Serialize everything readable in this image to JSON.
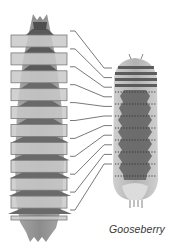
{
  "figure": {
    "caption": "Gooseberry",
    "left_body": {
      "description": "segmented larva, front view, with overlaid comparison strips",
      "strip_count": 11,
      "colors": {
        "body_light": "#bdbdbd",
        "body_mid": "#8f8f8f",
        "body_dark": "#5a5a5a",
        "strip_fill": "#c9c9c9",
        "strip_border": "#7a7a7a"
      }
    },
    "right_body": {
      "description": "gooseberry larva, dorsal view, banded head segments and dotted segment lines",
      "segment_count": 11,
      "colors": {
        "body_light": "#d6d6d6",
        "body_mid": "#9c9c9c",
        "body_dark": "#555555",
        "dot_line": "#2e2e2e"
      }
    },
    "connector_count": 11,
    "connector_color": "#6a6a6a"
  }
}
